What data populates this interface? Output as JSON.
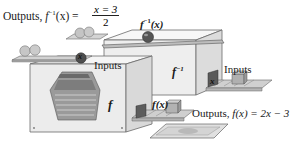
{
  "diagram": {
    "top_label": {
      "prefix": "Outputs, ",
      "func": "f",
      "sup": "−1",
      "arg": "(x) = ",
      "numerator": "x = 3",
      "denominator": "2"
    },
    "inverse_machine": {
      "face_label": "f",
      "face_sup": "−1",
      "top_label_func": "f",
      "top_label_sup": "−1",
      "top_label_arg": "(x)",
      "inputs_label": "Inputs",
      "input_cube_label": "x"
    },
    "forward_machine": {
      "face_label": "f",
      "inputs_label": "Inputs",
      "input_ball_label": "x",
      "output_label_func": "f",
      "output_label_arg": "(x)"
    },
    "bottom_label": {
      "prefix": "Outputs, ",
      "expr": "f(x) = 2x − 3"
    },
    "colors": {
      "box_fill": "#efefef",
      "box_side": "#d8d8d8",
      "box_top": "#f6f6f6",
      "edge": "#6a6a6a",
      "ball": "#bdbdbd",
      "dark_ball": "#4a4a4a",
      "cube": "#a9a9a9",
      "tray": "#cfcfcf",
      "interior": "#8f8f8f"
    }
  }
}
